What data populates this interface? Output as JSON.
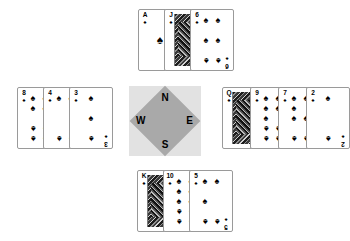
{
  "diagram": {
    "suit_symbol": "♠",
    "suit_name": "spades",
    "background_color": "#ffffff",
    "card_face_color": "#ffffff",
    "card_border_color": "#9a9a9a",
    "pip_color": "#000000"
  },
  "compass": {
    "square_color": "#e2e2e2",
    "diamond_color": "#a9a9a9",
    "label_color": "#000000",
    "north": "N",
    "west": "W",
    "east": "E",
    "south": "S"
  },
  "hands": {
    "north": {
      "position_label": "N",
      "cards": [
        {
          "rank": "A",
          "suit": "♠",
          "pips": 1,
          "face": false
        },
        {
          "rank": "J",
          "suit": "♠",
          "pips": 0,
          "face": true
        },
        {
          "rank": "6",
          "suit": "♠",
          "pips": 6,
          "face": false
        }
      ]
    },
    "west": {
      "position_label": "W",
      "cards": [
        {
          "rank": "8",
          "suit": "♠",
          "pips": 8,
          "face": false
        },
        {
          "rank": "4",
          "suit": "♠",
          "pips": 4,
          "face": false
        },
        {
          "rank": "3",
          "suit": "♠",
          "pips": 3,
          "face": false
        }
      ]
    },
    "east": {
      "position_label": "E",
      "cards": [
        {
          "rank": "Q",
          "suit": "♠",
          "pips": 0,
          "face": true
        },
        {
          "rank": "9",
          "suit": "♠",
          "pips": 9,
          "face": false
        },
        {
          "rank": "7",
          "suit": "♠",
          "pips": 7,
          "face": false
        },
        {
          "rank": "2",
          "suit": "♠",
          "pips": 2,
          "face": false
        }
      ]
    },
    "south": {
      "position_label": "S",
      "cards": [
        {
          "rank": "K",
          "suit": "♠",
          "pips": 0,
          "face": true
        },
        {
          "rank": "10",
          "suit": "♠",
          "pips": 10,
          "face": false
        },
        {
          "rank": "5",
          "suit": "♠",
          "pips": 5,
          "face": false
        }
      ]
    }
  }
}
